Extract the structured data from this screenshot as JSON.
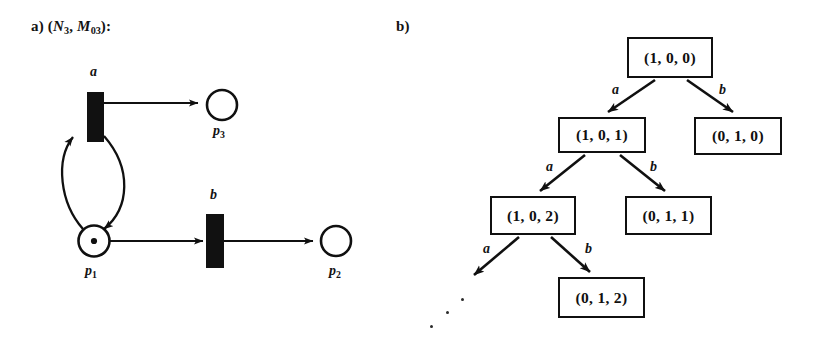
{
  "figure": {
    "background_color": "#ffffff",
    "ink_color": "#101010",
    "width": 824,
    "height": 352
  },
  "panels": {
    "a": {
      "label_prefix": "a)",
      "label_open": "(",
      "net_symbol": "N",
      "net_subscript": "3",
      "comma": ", ",
      "marking_symbol": "M",
      "marking_subscript": "03",
      "label_close": "):",
      "label_full": "a) (N3, M03):"
    },
    "b": {
      "label_prefix": "b)",
      "label_full": "b)"
    }
  },
  "petri_net": {
    "places": [
      {
        "id": "p1",
        "name": "p",
        "subscript": "1",
        "tokens": 1,
        "cx": 94,
        "cy": 241,
        "r": 15
      },
      {
        "id": "p2",
        "name": "p",
        "subscript": "2",
        "tokens": 0,
        "cx": 336,
        "cy": 241,
        "r": 15
      },
      {
        "id": "p3",
        "name": "p",
        "subscript": "3",
        "tokens": 0,
        "cx": 222,
        "cy": 105,
        "r": 15
      }
    ],
    "transitions": [
      {
        "id": "t_a",
        "label": "a",
        "x": 87,
        "y": 92,
        "w": 17,
        "h": 50
      },
      {
        "id": "t_b",
        "label": "b",
        "x": 206,
        "y": 214,
        "w": 18,
        "h": 54
      }
    ],
    "arcs": [
      {
        "from": "t_a",
        "to": "p3",
        "label": ""
      },
      {
        "from": "t_a",
        "to": "p1",
        "label": ""
      },
      {
        "from": "p1",
        "to": "t_a",
        "label": ""
      },
      {
        "from": "p1",
        "to": "t_b",
        "label": ""
      },
      {
        "from": "t_b",
        "to": "p2",
        "label": ""
      }
    ]
  },
  "reachability_tree": {
    "nodes": [
      {
        "id": "n0",
        "marking": "(1, 0, 0)",
        "x": 627,
        "y": 37,
        "w": 86,
        "h": 41,
        "depth": 0
      },
      {
        "id": "n1",
        "marking": "(1, 0, 1)",
        "x": 558,
        "y": 117,
        "w": 88,
        "h": 36,
        "depth": 1
      },
      {
        "id": "n2",
        "marking": "(0, 1, 0)",
        "x": 694,
        "y": 117,
        "w": 88,
        "h": 38,
        "depth": 1
      },
      {
        "id": "n3",
        "marking": "(1, 0, 2)",
        "x": 490,
        "y": 196,
        "w": 86,
        "h": 39,
        "depth": 2
      },
      {
        "id": "n4",
        "marking": "(0, 1, 1)",
        "x": 625,
        "y": 196,
        "w": 87,
        "h": 39,
        "depth": 2
      },
      {
        "id": "n5",
        "marking": "(0, 1, 2)",
        "x": 558,
        "y": 277,
        "w": 87,
        "h": 41,
        "depth": 3
      }
    ],
    "edges": [
      {
        "from": "n0",
        "to": "n1",
        "label": "a"
      },
      {
        "from": "n0",
        "to": "n2",
        "label": "b"
      },
      {
        "from": "n1",
        "to": "n3",
        "label": "a"
      },
      {
        "from": "n1",
        "to": "n4",
        "label": "b"
      },
      {
        "from": "n3",
        "to": "open",
        "label": "a"
      },
      {
        "from": "n3",
        "to": "n5",
        "label": "b"
      }
    ],
    "continuation_marker": {
      "type": "ellipsis-dots",
      "count": 3
    }
  }
}
